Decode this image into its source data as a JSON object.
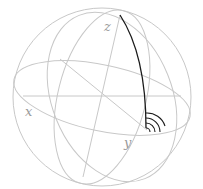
{
  "diagram": {
    "type": "sphere-with-axes",
    "labels": {
      "x": "x",
      "y": "y",
      "z": "z"
    },
    "colors": {
      "grid": "#c8c8c8",
      "highlight_arc": "#1a1a1a",
      "label": "#9a9a9a",
      "background": "#ffffff"
    },
    "signal_arcs_count": 4
  }
}
